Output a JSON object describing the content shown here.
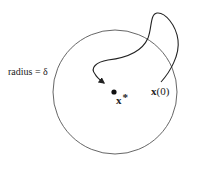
{
  "diagram": {
    "title": "",
    "labels": {
      "radius": "radius = δ",
      "equilibrium_symbol": "x",
      "equilibrium_superscript": "*",
      "initial_state_symbol": "x",
      "initial_state_arg": "(0)"
    },
    "shapes": {
      "ball": {
        "cx": 115,
        "cy": 92,
        "r": 62,
        "stroke": "#555555"
      },
      "equilibrium_point": {
        "cx": 114,
        "cy": 92,
        "r": 2.6,
        "fill": "#111111"
      },
      "trajectory": {
        "stroke": "#222222",
        "start": [
          161,
          82
        ],
        "end": [
          104,
          83
        ],
        "arrow_at_end": true
      }
    }
  }
}
